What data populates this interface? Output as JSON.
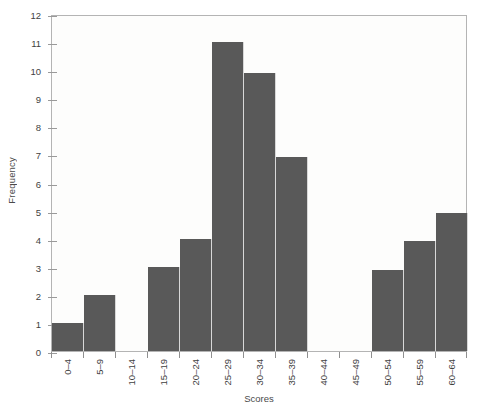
{
  "chart_data": {
    "type": "bar",
    "title": "",
    "subtitle": "",
    "xlabel": "Scores",
    "ylabel": "Frequency",
    "categories": [
      "0–4",
      "5–9",
      "10–14",
      "15–19",
      "20–24",
      "25–29",
      "30–34",
      "35–39",
      "40–44",
      "45–49",
      "50–54",
      "55–59",
      "60–64"
    ],
    "values": [
      1,
      2,
      0,
      3,
      4,
      11,
      9.9,
      6.9,
      0,
      0,
      2.9,
      3.9,
      4.9
    ],
    "series": [
      {
        "name": "Frequency",
        "values": [
          1,
          2,
          0,
          3,
          4,
          11,
          9.9,
          6.9,
          0,
          0,
          2.9,
          3.9,
          4.9
        ]
      }
    ],
    "ylim": [
      0,
      12
    ],
    "yticks": [
      0,
      1,
      2,
      3,
      4,
      5,
      6,
      7,
      8,
      9,
      10,
      11,
      12
    ],
    "ytick_labels": [
      "0",
      "1",
      "2",
      "3",
      "4",
      "5",
      "6",
      "7",
      "8",
      "9",
      "10",
      "11",
      "12"
    ],
    "grid": false,
    "legend": false,
    "legend_position": "none",
    "bar_color": "#595959",
    "frame_color": "#b4b4b4",
    "background_color": "#fdfdfc",
    "text_color": "#3f3f3f"
  }
}
